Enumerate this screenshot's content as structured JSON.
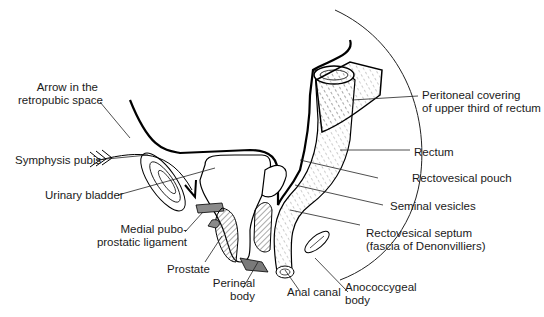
{
  "figure": {
    "labels": {
      "arrow_retropubic": [
        "Arrow in the",
        "retropubic space"
      ],
      "symphysis_pubis": "Symphysis pubis",
      "urinary_bladder": "Urinary bladder",
      "medial_puboprostatic": [
        "Medial pubo-",
        "prostatic ligament"
      ],
      "prostate": "Prostate",
      "perineal_body": [
        "Perineal",
        "body"
      ],
      "anal_canal": "Anal canal",
      "anococcygeal_body": [
        "Anococcygeal",
        "body"
      ],
      "rectovesical_septum": [
        "Rectovesical septum",
        "(fascia of Denonvilliers)"
      ],
      "seminal_vesicles": "Seminal vesicles",
      "rectovesical_pouch": "Rectovesical pouch",
      "rectum": "Rectum",
      "peritoneal_covering": [
        "Peritoneal covering",
        "of upper third of rectum"
      ]
    },
    "colors": {
      "line": "#111111",
      "shaded": "#8a8a8a",
      "hatch": "#444444",
      "background": "#ffffff"
    }
  }
}
